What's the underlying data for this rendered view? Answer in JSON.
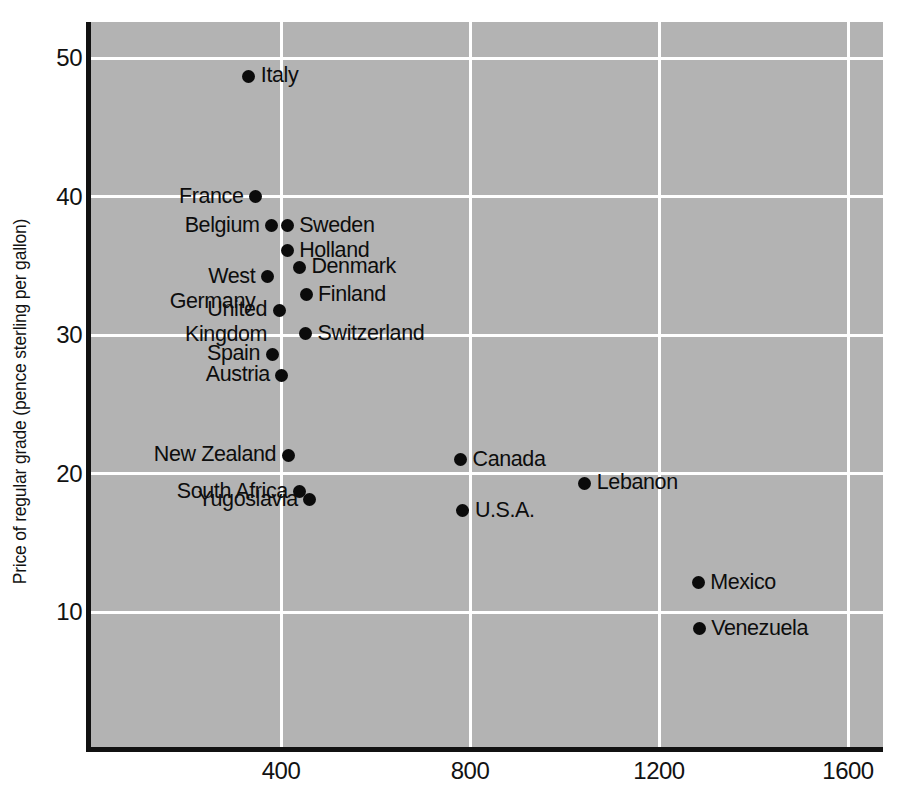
{
  "chart_data": {
    "type": "scatter",
    "title": "",
    "xlabel": "",
    "ylabel": "Price of regular grade (pence sterling per gallon)",
    "xlim": [
      0,
      1750
    ],
    "ylim": [
      0,
      54.5
    ],
    "xticks": [
      400,
      800,
      1200,
      1600
    ],
    "yticks": [
      10,
      20,
      30,
      40,
      50
    ],
    "grid": true,
    "legend": "none",
    "plot_background_color": "#b3b3b3",
    "point_color": "#0b0b0b",
    "gridline_color": "#ffffff",
    "axis_color": "#111111",
    "points": [
      {
        "label": "Italy",
        "x": 332,
        "y": 48.7,
        "label_side": "right"
      },
      {
        "label": "France",
        "x": 346,
        "y": 40.0,
        "label_side": "left"
      },
      {
        "label": "Belgium",
        "x": 380,
        "y": 37.9,
        "label_side": "left"
      },
      {
        "label": "Sweden",
        "x": 413,
        "y": 37.9,
        "label_side": "right"
      },
      {
        "label": "Holland",
        "x": 413,
        "y": 36.1,
        "label_side": "right"
      },
      {
        "label": "Denmark",
        "x": 439,
        "y": 34.9,
        "label_side": "right"
      },
      {
        "label": "West\nGermany",
        "x": 371,
        "y": 34.2,
        "label_side": "left"
      },
      {
        "label": "Finland",
        "x": 453,
        "y": 32.9,
        "label_side": "right"
      },
      {
        "label": "United\nKingdom",
        "x": 396,
        "y": 31.8,
        "label_side": "left"
      },
      {
        "label": "Switzerland",
        "x": 452,
        "y": 30.1,
        "label_side": "right"
      },
      {
        "label": "Spain",
        "x": 381,
        "y": 28.6,
        "label_side": "left"
      },
      {
        "label": "Austria",
        "x": 402,
        "y": 27.1,
        "label_side": "left"
      },
      {
        "label": "New Zealand",
        "x": 415,
        "y": 21.3,
        "label_side": "left"
      },
      {
        "label": "Canada",
        "x": 780,
        "y": 21.0,
        "label_side": "right"
      },
      {
        "label": "Lebanon",
        "x": 1043,
        "y": 19.3,
        "label_side": "right"
      },
      {
        "label": "South Africa",
        "x": 440,
        "y": 18.7,
        "label_side": "left"
      },
      {
        "label": "Yugoslavia",
        "x": 461,
        "y": 18.1,
        "label_side": "left"
      },
      {
        "label": "U.S.A.",
        "x": 785,
        "y": 17.3,
        "label_side": "right"
      },
      {
        "label": "Mexico",
        "x": 1283,
        "y": 12.1,
        "label_side": "right"
      },
      {
        "label": "Venezuela",
        "x": 1285,
        "y": 8.8,
        "label_side": "right"
      }
    ]
  }
}
